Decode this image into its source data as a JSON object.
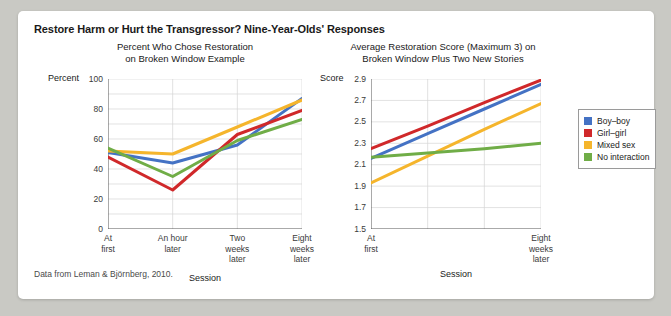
{
  "figure": {
    "title": "Restore Harm or Hurt the Transgressor? Nine-Year-Olds' Responses",
    "source_note": "Data from Leman & Björnberg, 2010."
  },
  "legend": {
    "position": "right",
    "items": [
      {
        "label": "Boy–boy",
        "color": "#4472c4"
      },
      {
        "label": "Girl–girl",
        "color": "#d0282a"
      },
      {
        "label": "Mixed sex",
        "color": "#f5b52c"
      },
      {
        "label": "No interaction",
        "color": "#70ad47"
      }
    ]
  },
  "chart_data": [
    {
      "type": "line",
      "panel": "left",
      "title": "Percent Who Chose Restoration on Broken Window Example",
      "title_line1": "Percent Who Chose Restoration",
      "title_line2": "on Broken Window Example",
      "ylabel": "Percent",
      "xlabel": "Session",
      "ylim": [
        0,
        100
      ],
      "yticks": [
        0,
        20,
        40,
        60,
        80,
        100
      ],
      "ytick_labels": [
        "0",
        "20",
        "40",
        "60",
        "80",
        "100"
      ],
      "gridlines": [
        10,
        20,
        30,
        40,
        50,
        60,
        70,
        80,
        90,
        100
      ],
      "grid": true,
      "categories": [
        "At first",
        "An hour later",
        "Two weeks later",
        "Eight weeks later"
      ],
      "category_lines": [
        [
          "At",
          "first"
        ],
        [
          "An hour",
          "later"
        ],
        [
          "Two",
          "weeks",
          "later"
        ],
        [
          "Eight",
          "weeks",
          "later"
        ]
      ],
      "series": [
        {
          "name": "Boy–boy",
          "color": "#4472c4",
          "values": [
            51,
            44,
            56,
            87
          ]
        },
        {
          "name": "Girl–girl",
          "color": "#d0282a",
          "values": [
            48,
            26,
            63,
            79
          ]
        },
        {
          "name": "Mixed sex",
          "color": "#f5b52c",
          "values": [
            52,
            50,
            68,
            86
          ]
        },
        {
          "name": "No interaction",
          "color": "#70ad47",
          "values": [
            54,
            35,
            59,
            73
          ]
        }
      ]
    },
    {
      "type": "line",
      "panel": "right",
      "title": "Average Restoration Score (Maximum 3) on Broken Window Plus Two New Stories",
      "title_line1": "Average Restoration Score (Maximum 3) on",
      "title_line2": "Broken Window Plus Two New Stories",
      "ylabel": "Score",
      "xlabel": "Session",
      "ylim": [
        1.5,
        2.9
      ],
      "yticks": [
        1.5,
        1.7,
        1.9,
        2.1,
        2.3,
        2.5,
        2.7,
        2.9
      ],
      "ytick_labels": [
        "1.5",
        "1.7",
        "1.9",
        "2.1",
        "2.3",
        "2.5",
        "2.7",
        "2.9"
      ],
      "grid": true,
      "categories": [
        "At first",
        "",
        "",
        "Eight weeks later"
      ],
      "category_lines": [
        [
          "At",
          "first"
        ],
        [],
        [],
        [
          "Eight",
          "weeks",
          "later"
        ]
      ],
      "series": [
        {
          "name": "Boy–boy",
          "color": "#4472c4",
          "values": [
            2.16,
            2.39,
            2.62,
            2.85
          ]
        },
        {
          "name": "Girl–girl",
          "color": "#d0282a",
          "values": [
            2.25,
            2.46,
            2.68,
            2.89
          ]
        },
        {
          "name": "Mixed sex",
          "color": "#f5b52c",
          "values": [
            1.93,
            2.18,
            2.43,
            2.67
          ]
        },
        {
          "name": "No interaction",
          "color": "#70ad47",
          "values": [
            2.17,
            2.21,
            2.25,
            2.3
          ]
        }
      ]
    }
  ]
}
